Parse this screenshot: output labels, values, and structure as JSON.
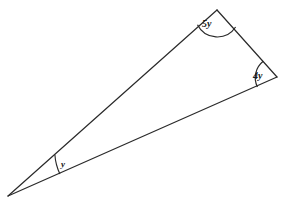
{
  "figure": {
    "name": "triangle-angle-diagram",
    "background_color": "#ffffff",
    "stroke_color": "#2a2a2a",
    "text_color": "#1a1a1a",
    "width": 285,
    "height": 205,
    "clipped_header_text": "· · ·",
    "vertices": {
      "left": {
        "label": "left-vertex",
        "x": 8,
        "y": 196
      },
      "top": {
        "label": "top-vertex",
        "x": 217,
        "y": 10
      },
      "right": {
        "label": "right-vertex",
        "x": 277,
        "y": 77
      }
    },
    "edges": [
      {
        "name": "left-to-top-edge",
        "from": "left",
        "to": "top"
      },
      {
        "name": "top-to-right-edge",
        "from": "top",
        "to": "right"
      },
      {
        "name": "right-to-left-edge",
        "from": "right",
        "to": "left"
      }
    ],
    "angles": [
      {
        "name": "top-angle",
        "vertex": "top",
        "label": "5y",
        "arc_radius": 22,
        "arc_path": "M 197.5 24.8 A 22 22 0 0 0 235.6 27.0"
      },
      {
        "name": "right-angle",
        "vertex": "right",
        "label": "4y",
        "arc_radius": 21,
        "arc_path": "M 263.2 61.3 A 21 21 0 0 0 257.4 87.0"
      },
      {
        "name": "left-angle",
        "vertex": "left",
        "label": "y",
        "arc_radius": 52,
        "arc_path": "M 54.9 154.9 A 52 52 0 0 0 59.9 173.9"
      }
    ]
  }
}
